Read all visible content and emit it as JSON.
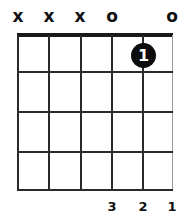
{
  "chord": {
    "strings": [
      "E",
      "A",
      "D",
      "G",
      "B",
      "e"
    ],
    "open_muted": [
      "x",
      "x",
      "x",
      "o",
      "",
      "o"
    ],
    "frets_shown": 4,
    "dots": [
      {
        "string": 5,
        "fret": 1,
        "finger": "1"
      }
    ],
    "finger_labels_bottom": [
      "",
      "",
      "",
      "3",
      "2",
      "1"
    ]
  }
}
